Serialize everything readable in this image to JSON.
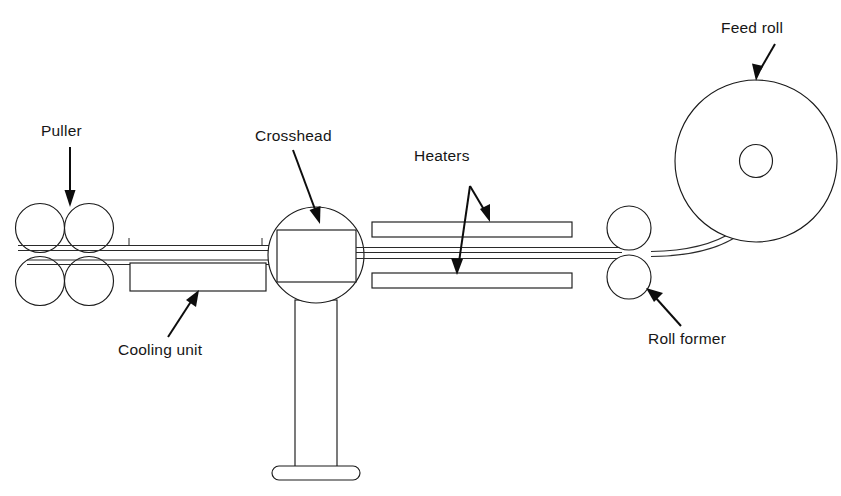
{
  "diagram": {
    "type": "mechanical-process-diagram",
    "background_color": "#ffffff",
    "line_color": "#1a1a1a",
    "text_color": "#161616",
    "labels": [
      {
        "id": "puller",
        "text": "Puller",
        "x": 41,
        "y": 136,
        "anchor": "start"
      },
      {
        "id": "crosshead",
        "text": "Crosshead",
        "x": 255,
        "y": 141,
        "anchor": "start"
      },
      {
        "id": "heaters",
        "text": "Heaters",
        "x": 414,
        "y": 161,
        "anchor": "start"
      },
      {
        "id": "feed-roll",
        "text": "Feed roll",
        "x": 721,
        "y": 33,
        "anchor": "start"
      },
      {
        "id": "cooling-unit",
        "text": "Cooling unit",
        "x": 118,
        "y": 355,
        "anchor": "start"
      },
      {
        "id": "roll-former",
        "text": "Roll former",
        "x": 648,
        "y": 344,
        "anchor": "start"
      }
    ],
    "components": [
      {
        "id": "puller",
        "name": "Puller",
        "description": "Four nip rolls in two pairs, two above and two below the strand"
      },
      {
        "id": "cooling-unit",
        "name": "Cooling unit",
        "description": "Rectangular trough below the strand between puller and crosshead"
      },
      {
        "id": "crosshead",
        "name": "Crosshead",
        "description": "Circular body with inscribed rectangular die, mounted on a pedestal column with base plate"
      },
      {
        "id": "heaters",
        "name": "Heaters",
        "description": "Two long rectangular heater bars, one above and one below the strand"
      },
      {
        "id": "roll-former",
        "name": "Roll former",
        "description": "Two stacked rolls forming a nip on the strand"
      },
      {
        "id": "feed-roll",
        "name": "Feed roll",
        "description": "Large supply reel with central hub"
      }
    ]
  }
}
